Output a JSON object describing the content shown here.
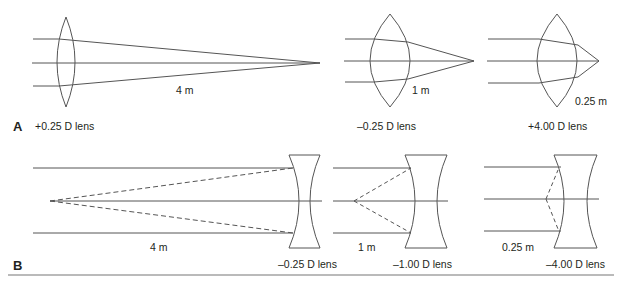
{
  "figure": {
    "panels": [
      {
        "id": "A",
        "label": "A",
        "type": "converging",
        "lenses": [
          {
            "power_label": "+0.25 D lens",
            "distance_label": "4 m"
          },
          {
            "power_label": "+1.00 D lens",
            "distance_label": "1 m"
          },
          {
            "power_label": "+4.00 D lens",
            "distance_label": "0.25 m"
          }
        ]
      },
      {
        "id": "B",
        "label": "B",
        "type": "diverging",
        "lenses": [
          {
            "power_label": "–0.25 D lens",
            "distance_label": "4 m"
          },
          {
            "power_label": "–1.00 D lens",
            "distance_label": "1 m"
          },
          {
            "power_label": "–4.00 D lens",
            "distance_label": "0.25 m"
          }
        ]
      }
    ],
    "colors": {
      "line": "#555555",
      "text": "#231f20",
      "rule": "#777777"
    }
  }
}
